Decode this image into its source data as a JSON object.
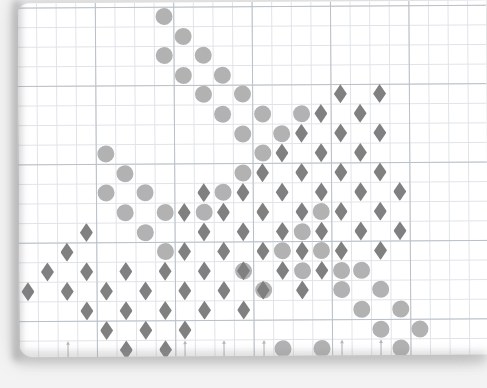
{
  "figure": {
    "kind": "scatter-on-graph-paper",
    "background_color": "#f3f3f3",
    "paper_color": "#ffffff",
    "minor_grid_color": "#dfe3e8",
    "major_grid_color": "#b9c0c7",
    "minor_grid_px": 19.6,
    "major_every": 4
  },
  "legend_colors": {
    "circle": "#b2b2b2",
    "diamond": "#808080",
    "arrow": "#b7b7b7"
  },
  "chart_data": {
    "type": "scatter",
    "title": "",
    "subtitle": "",
    "xlabel": "",
    "ylabel": "",
    "grid": true,
    "legend_position": "none",
    "xlim": [
      0,
      24
    ],
    "ylim": [
      0,
      18
    ],
    "cell_px": 19.6,
    "origin_px": [
      -0.5,
      4.2
    ],
    "series": [
      {
        "name": "circle",
        "marker": "circle",
        "color": "#b2b2b2",
        "size_px": 17,
        "points": [
          [
            7.5,
            0.5
          ],
          [
            8.5,
            1.5
          ],
          [
            7.5,
            2.5
          ],
          [
            9.5,
            2.5
          ],
          [
            8.5,
            3.5
          ],
          [
            10.5,
            3.5
          ],
          [
            9.5,
            4.5
          ],
          [
            11.5,
            4.5
          ],
          [
            10.5,
            5.5
          ],
          [
            12.5,
            5.5
          ],
          [
            14.5,
            5.5
          ],
          [
            11.5,
            6.5
          ],
          [
            13.5,
            6.5
          ],
          [
            4.5,
            7.5
          ],
          [
            12.5,
            7.5
          ],
          [
            5.5,
            8.5
          ],
          [
            11.5,
            8.5
          ],
          [
            4.5,
            9.5
          ],
          [
            6.5,
            9.5
          ],
          [
            10.5,
            9.5
          ],
          [
            5.5,
            10.5
          ],
          [
            7.5,
            10.5
          ],
          [
            9.5,
            10.5
          ],
          [
            15.5,
            10.5
          ],
          [
            6.5,
            11.5
          ],
          [
            14.5,
            11.5
          ],
          [
            7.5,
            12.5
          ],
          [
            13.5,
            12.5
          ],
          [
            15.5,
            12.5
          ],
          [
            11.5,
            13.5
          ],
          [
            14.5,
            13.5
          ],
          [
            16.5,
            13.5
          ],
          [
            17.5,
            13.5
          ],
          [
            12.5,
            14.5
          ],
          [
            16.5,
            14.5
          ],
          [
            18.5,
            14.5
          ],
          [
            17.5,
            15.5
          ],
          [
            19.5,
            15.5
          ],
          [
            18.5,
            16.5
          ],
          [
            20.5,
            16.5
          ],
          [
            19.5,
            17.5
          ],
          [
            13.5,
            17.5
          ],
          [
            15.5,
            17.5
          ]
        ]
      },
      {
        "name": "diamond",
        "marker": "diamond",
        "color": "#808080",
        "size_px": [
          13,
          19
        ],
        "points": [
          [
            16.5,
            4.5
          ],
          [
            18.5,
            4.5
          ],
          [
            15.5,
            5.5
          ],
          [
            17.5,
            5.5
          ],
          [
            14.5,
            6.5
          ],
          [
            16.5,
            6.5
          ],
          [
            18.5,
            6.5
          ],
          [
            13.5,
            7.5
          ],
          [
            15.5,
            7.5
          ],
          [
            17.5,
            7.5
          ],
          [
            12.5,
            8.5
          ],
          [
            14.5,
            8.5
          ],
          [
            16.5,
            8.5
          ],
          [
            18.5,
            8.5
          ],
          [
            9.5,
            9.5
          ],
          [
            11.5,
            9.5
          ],
          [
            13.5,
            9.5
          ],
          [
            15.5,
            9.5
          ],
          [
            17.5,
            9.5
          ],
          [
            19.5,
            9.5
          ],
          [
            8.5,
            10.5
          ],
          [
            10.5,
            10.5
          ],
          [
            12.5,
            10.5
          ],
          [
            14.5,
            10.5
          ],
          [
            16.5,
            10.5
          ],
          [
            18.5,
            10.5
          ],
          [
            3.5,
            11.5
          ],
          [
            9.5,
            11.5
          ],
          [
            11.5,
            11.5
          ],
          [
            13.5,
            11.5
          ],
          [
            15.5,
            11.5
          ],
          [
            17.5,
            11.5
          ],
          [
            19.5,
            11.5
          ],
          [
            2.5,
            12.5
          ],
          [
            8.5,
            12.5
          ],
          [
            10.5,
            12.5
          ],
          [
            12.5,
            12.5
          ],
          [
            14.5,
            12.5
          ],
          [
            16.5,
            12.5
          ],
          [
            18.5,
            12.5
          ],
          [
            1.5,
            13.5
          ],
          [
            3.5,
            13.5
          ],
          [
            5.5,
            13.5
          ],
          [
            7.5,
            13.5
          ],
          [
            9.5,
            13.5
          ],
          [
            11.5,
            13.5
          ],
          [
            13.5,
            13.5
          ],
          [
            15.5,
            13.5
          ],
          [
            0.5,
            14.5
          ],
          [
            2.5,
            14.5
          ],
          [
            4.5,
            14.5
          ],
          [
            6.5,
            14.5
          ],
          [
            8.5,
            14.5
          ],
          [
            10.5,
            14.5
          ],
          [
            12.5,
            14.5
          ],
          [
            14.5,
            14.5
          ],
          [
            3.5,
            15.5
          ],
          [
            5.5,
            15.5
          ],
          [
            7.5,
            15.5
          ],
          [
            9.5,
            15.5
          ],
          [
            11.5,
            15.5
          ],
          [
            4.5,
            16.5
          ],
          [
            6.5,
            16.5
          ],
          [
            8.5,
            16.5
          ],
          [
            5.5,
            17.5
          ],
          [
            7.5,
            17.5
          ]
        ]
      },
      {
        "name": "arrow",
        "marker": "arrow-up",
        "color": "#b7b7b7",
        "points": [
          [
            2.5,
            17.5
          ],
          [
            8.5,
            17.5
          ],
          [
            10.5,
            17.5
          ],
          [
            12.5,
            17.5
          ],
          [
            16.5,
            17.5
          ],
          [
            18.5,
            17.5
          ]
        ]
      }
    ]
  }
}
